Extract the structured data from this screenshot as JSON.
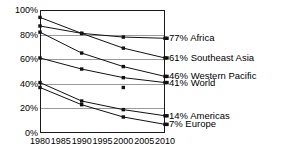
{
  "chart_data": {
    "type": "line",
    "title": "",
    "subtitle": "",
    "xlabel": "",
    "ylabel": "",
    "xlim": [
      1980,
      2010
    ],
    "ylim": [
      0,
      100
    ],
    "grid": true,
    "legend_position": "right-endpoint-labels",
    "x": [
      1980,
      1990,
      2000,
      2010
    ],
    "xtick_labels": [
      "1980",
      "1985",
      "1990",
      "1995",
      "2000",
      "2005",
      "2010"
    ],
    "xticks": [
      1980,
      1985,
      1990,
      1995,
      2000,
      2005,
      2010
    ],
    "ytick_labels": [
      "0%",
      "20%",
      "40%",
      "60%",
      "80%",
      "100%"
    ],
    "yticks": [
      0,
      20,
      40,
      60,
      80,
      100
    ],
    "series": [
      {
        "name": "Africa",
        "end_label": "77% Africa",
        "end_value": 77,
        "values": [
          94,
          81,
          78,
          77
        ],
        "marker": "square",
        "color": "#111111"
      },
      {
        "name": "Southeast Asia",
        "end_label": "61% Southeast Asia",
        "end_value": 61,
        "values": [
          87,
          81,
          69,
          61
        ],
        "marker": "square",
        "color": "#111111"
      },
      {
        "name": "Western Pacific",
        "end_label": "46% Western Pacific",
        "end_value": 46,
        "values": [
          82,
          65,
          54,
          46
        ],
        "marker": "square",
        "color": "#111111"
      },
      {
        "name": "World",
        "end_label": "41% World",
        "end_value": 41,
        "values": [
          61,
          52,
          45,
          41
        ],
        "marker": "square",
        "color": "#111111"
      },
      {
        "name": "Americas",
        "end_label": "14% Americas",
        "end_value": 14,
        "values": [
          41,
          26,
          19,
          14
        ],
        "marker": "square",
        "color": "#111111"
      },
      {
        "name": "Europe",
        "end_label": "7% Europe",
        "end_value": 7,
        "values": [
          37,
          23,
          13,
          7
        ],
        "marker": "square",
        "color": "#111111"
      }
    ],
    "extra_markers": [
      {
        "name": "world-2000-marker",
        "x": 2000,
        "y": 37
      }
    ]
  },
  "colors": {
    "line": "#111111",
    "grid": "#9a9a9a",
    "frame": "#1a1a1a",
    "text": "#000000",
    "background": "#ffffff"
  }
}
